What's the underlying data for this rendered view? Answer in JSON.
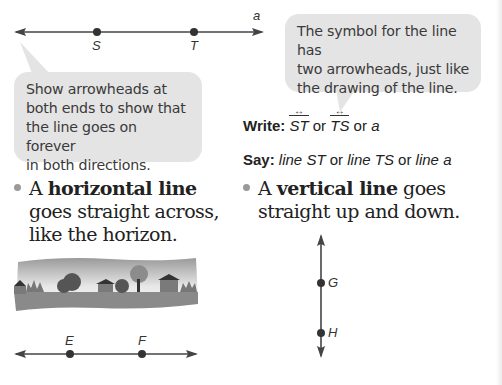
{
  "top_line": {
    "line_label": "a",
    "points": [
      {
        "name": "S",
        "x": 97
      },
      {
        "name": "T",
        "x": 194
      }
    ]
  },
  "bubble_left": {
    "lines": [
      "Show arrowheads at",
      "both ends to show that",
      "the line goes on forever",
      "in both directions."
    ]
  },
  "bubble_right": {
    "lines": [
      "The symbol for the line has",
      "two arrowheads, just like",
      "the drawing of the line."
    ]
  },
  "write": {
    "label": "Write:",
    "sym1": "ST",
    "or1": "or",
    "sym2": "TS",
    "or2": "or",
    "sym3": "a"
  },
  "say": {
    "label": "Say:",
    "opt1": "line ST",
    "or1": "or",
    "opt2": "line TS",
    "or2": "or",
    "opt3": "line a"
  },
  "horizontal": {
    "prefix": "A",
    "term": "horizontal line",
    "line2": "goes straight across,",
    "line3": "like the horizon."
  },
  "vertical": {
    "prefix": "A",
    "term": "vertical line",
    "suffix": "goes",
    "line2": "straight up and down."
  },
  "horizontal_line": {
    "points": [
      {
        "name": "E",
        "x": 70
      },
      {
        "name": "F",
        "x": 142
      }
    ]
  },
  "vertical_line": {
    "points": [
      {
        "name": "G",
        "y": 283
      },
      {
        "name": "H",
        "y": 333
      }
    ]
  },
  "colors": {
    "bubble": "#e4e4e4",
    "line": "#444444",
    "bullet": "#9a9a9a"
  }
}
